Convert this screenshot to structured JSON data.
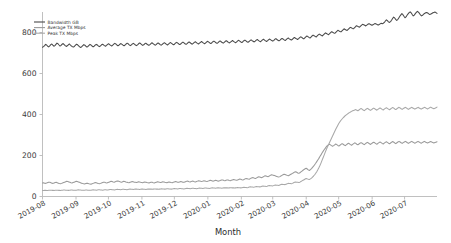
{
  "chart_data": {
    "type": "line",
    "title": "",
    "xlabel": "Month",
    "ylabel": "",
    "grid": false,
    "legend_position": "upper-left",
    "xlim": [
      0,
      365
    ],
    "ylim": [
      0,
      900
    ],
    "yticks": [
      0,
      200,
      400,
      600,
      800
    ],
    "ytick_labels": [
      "0",
      "200",
      "400",
      "600",
      "800"
    ],
    "xtick_labels": [
      "2019-08",
      "2019-09",
      "2019-10",
      "2019-11",
      "2019-12",
      "2020-01",
      "2020-02",
      "2020-03",
      "2020-04",
      "2020-05",
      "2020-06",
      "2020-07"
    ],
    "xtick_positions": [
      0,
      31,
      61,
      92,
      122,
      153,
      184,
      213,
      244,
      274,
      305,
      335
    ],
    "series": [
      {
        "name": "Bandwidth GB",
        "color": "#4a4a4a",
        "values": [
          728,
          731,
          736,
          742,
          739,
          733,
          730,
          735,
          741,
          744,
          738,
          733,
          736,
          742,
          748,
          745,
          739,
          734,
          737,
          743,
          746,
          741,
          736,
          732,
          735,
          740,
          744,
          739,
          734,
          731,
          729,
          733,
          738,
          743,
          740,
          735,
          730,
          727,
          731,
          736,
          741,
          738,
          733,
          729,
          732,
          737,
          742,
          739,
          734,
          730,
          733,
          738,
          742,
          740,
          735,
          731,
          734,
          739,
          743,
          740,
          736,
          733,
          737,
          742,
          745,
          741,
          737,
          734,
          738,
          743,
          747,
          744,
          739,
          735,
          738,
          743,
          746,
          742,
          738,
          735,
          739,
          744,
          748,
          745,
          740,
          736,
          739,
          744,
          747,
          743,
          739,
          736,
          740,
          745,
          749,
          746,
          741,
          737,
          740,
          745,
          748,
          744,
          740,
          737,
          741,
          746,
          750,
          746,
          742,
          738,
          741,
          746,
          749,
          745,
          741,
          738,
          742,
          747,
          750,
          747,
          742,
          739,
          743,
          748,
          751,
          747,
          743,
          740,
          744,
          749,
          752,
          748,
          744,
          741,
          745,
          750,
          753,
          749,
          745,
          742,
          746,
          751,
          754,
          750,
          746,
          743,
          747,
          752,
          755,
          751,
          747,
          744,
          748,
          752,
          756,
          752,
          748,
          745,
          749,
          754,
          757,
          753,
          749,
          746,
          750,
          755,
          758,
          754,
          750,
          747,
          751,
          756,
          759,
          755,
          751,
          748,
          752,
          757,
          760,
          756,
          752,
          749,
          753,
          757,
          761,
          757,
          753,
          750,
          754,
          759,
          762,
          758,
          754,
          751,
          755,
          760,
          763,
          759,
          755,
          752,
          756,
          761,
          764,
          760,
          757,
          754,
          758,
          763,
          766,
          762,
          758,
          755,
          759,
          764,
          767,
          763,
          759,
          756,
          760,
          765,
          768,
          764,
          761,
          758,
          762,
          767,
          770,
          766,
          762,
          759,
          763,
          768,
          771,
          768,
          764,
          761,
          765,
          770,
          773,
          769,
          766,
          763,
          767,
          772,
          776,
          772,
          769,
          766,
          770,
          775,
          779,
          776,
          772,
          769,
          774,
          779,
          783,
          780,
          776,
          773,
          778,
          783,
          787,
          784,
          781,
          778,
          783,
          788,
          792,
          789,
          786,
          783,
          788,
          793,
          798,
          795,
          792,
          789,
          794,
          799,
          804,
          801,
          798,
          796,
          801,
          806,
          811,
          808,
          805,
          803,
          808,
          813,
          818,
          815,
          812,
          810,
          815,
          820,
          825,
          823,
          820,
          818,
          823,
          828,
          833,
          831,
          828,
          826,
          831,
          836,
          840,
          838,
          835,
          832,
          836,
          840,
          843,
          841,
          838,
          835,
          838,
          841,
          844,
          842,
          839,
          836,
          839,
          842,
          845,
          843,
          845,
          849,
          856,
          862,
          858,
          852,
          849,
          853,
          860,
          868,
          875,
          871,
          864,
          859,
          863,
          871,
          879,
          886,
          892,
          887,
          879,
          872,
          876,
          884,
          891,
          897,
          901,
          896,
          888,
          881,
          885,
          892,
          898,
          903,
          899,
          893,
          886,
          881,
          884,
          889,
          893,
          896,
          898,
          895,
          891,
          888,
          890,
          893,
          896,
          898,
          900,
          897,
          893
        ]
      },
      {
        "name": "Average TX Mbps",
        "color": "#9a9a9a",
        "values": [
          66,
          67,
          65,
          64,
          66,
          68,
          70,
          69,
          67,
          65,
          64,
          66,
          68,
          69,
          67,
          65,
          63,
          62,
          64,
          66,
          68,
          70,
          72,
          74,
          73,
          71,
          69,
          67,
          66,
          68,
          70,
          72,
          74,
          73,
          71,
          69,
          67,
          65,
          63,
          62,
          61,
          63,
          65,
          64,
          62,
          61,
          60,
          62,
          64,
          66,
          68,
          67,
          65,
          63,
          62,
          64,
          66,
          68,
          70,
          69,
          67,
          66,
          68,
          70,
          72,
          74,
          73,
          71,
          70,
          72,
          74,
          76,
          75,
          73,
          71,
          70,
          72,
          74,
          73,
          71,
          70,
          68,
          67,
          69,
          71,
          73,
          72,
          70,
          69,
          68,
          70,
          72,
          71,
          69,
          68,
          67,
          69,
          71,
          70,
          68,
          67,
          66,
          68,
          70,
          69,
          67,
          66,
          68,
          70,
          72,
          71,
          69,
          68,
          70,
          72,
          71,
          69,
          68,
          67,
          69,
          71,
          70,
          68,
          67,
          69,
          71,
          73,
          72,
          70,
          69,
          71,
          73,
          72,
          70,
          69,
          71,
          73,
          75,
          74,
          72,
          71,
          73,
          75,
          74,
          72,
          71,
          73,
          75,
          77,
          76,
          74,
          73,
          75,
          77,
          76,
          74,
          73,
          75,
          77,
          79,
          78,
          76,
          75,
          77,
          79,
          78,
          76,
          75,
          77,
          79,
          81,
          80,
          78,
          77,
          79,
          81,
          80,
          78,
          77,
          79,
          81,
          83,
          82,
          80,
          79,
          81,
          83,
          85,
          84,
          82,
          81,
          83,
          86,
          88,
          87,
          85,
          84,
          87,
          90,
          92,
          91,
          89,
          88,
          91,
          94,
          96,
          95,
          93,
          92,
          95,
          98,
          101,
          100,
          98,
          97,
          100,
          103,
          106,
          105,
          103,
          102,
          100,
          98,
          96,
          95,
          97,
          100,
          103,
          106,
          109,
          107,
          105,
          103,
          101,
          104,
          107,
          110,
          113,
          116,
          119,
          121,
          118,
          115,
          113,
          116,
          120,
          124,
          128,
          132,
          135,
          138,
          134,
          130,
          127,
          131,
          136,
          142,
          148,
          155,
          162,
          170,
          178,
          186,
          195,
          203,
          212,
          220,
          228,
          235,
          242,
          248,
          252,
          255,
          252,
          248,
          245,
          248,
          252,
          256,
          253,
          249,
          246,
          250,
          254,
          258,
          255,
          251,
          248,
          252,
          256,
          260,
          257,
          253,
          250,
          254,
          258,
          262,
          259,
          255,
          252,
          256,
          260,
          263,
          260,
          256,
          253,
          257,
          261,
          264,
          261,
          257,
          254,
          258,
          262,
          265,
          262,
          258,
          255,
          259,
          263,
          266,
          263,
          259,
          256,
          260,
          264,
          267,
          264,
          260,
          257,
          261,
          265,
          268,
          265,
          261,
          258,
          262,
          266,
          269,
          266,
          262,
          259,
          263,
          266,
          269,
          266,
          262,
          259,
          263,
          266,
          269,
          266,
          263,
          260,
          263,
          266,
          269,
          266,
          263,
          260,
          263,
          266,
          269,
          266,
          263,
          261,
          263,
          266,
          268,
          266,
          263,
          261,
          263,
          265,
          267
        ]
      },
      {
        "name": "Peak TX Mbps",
        "color": "#a8a8a8",
        "values": [
          29,
          29,
          30,
          30,
          29,
          29,
          30,
          31,
          31,
          30,
          30,
          29,
          30,
          31,
          31,
          30,
          30,
          29,
          30,
          31,
          32,
          32,
          31,
          31,
          30,
          30,
          31,
          32,
          32,
          31,
          31,
          30,
          31,
          32,
          33,
          32,
          32,
          31,
          31,
          30,
          31,
          32,
          32,
          31,
          31,
          30,
          31,
          32,
          33,
          32,
          32,
          31,
          32,
          33,
          33,
          32,
          32,
          31,
          32,
          33,
          33,
          32,
          32,
          33,
          34,
          34,
          33,
          33,
          32,
          33,
          34,
          35,
          34,
          34,
          33,
          34,
          35,
          35,
          34,
          34,
          33,
          34,
          35,
          36,
          35,
          35,
          34,
          35,
          36,
          36,
          35,
          35,
          34,
          35,
          36,
          36,
          35,
          35,
          34,
          35,
          36,
          37,
          36,
          36,
          35,
          36,
          37,
          37,
          36,
          36,
          35,
          36,
          37,
          38,
          37,
          37,
          36,
          37,
          38,
          38,
          37,
          37,
          36,
          37,
          38,
          39,
          38,
          38,
          37,
          38,
          39,
          39,
          38,
          38,
          37,
          38,
          39,
          40,
          39,
          39,
          38,
          39,
          40,
          40,
          39,
          39,
          38,
          39,
          40,
          41,
          40,
          40,
          39,
          40,
          41,
          41,
          40,
          40,
          39,
          40,
          41,
          42,
          41,
          41,
          40,
          41,
          42,
          42,
          41,
          41,
          40,
          41,
          42,
          43,
          42,
          42,
          41,
          42,
          43,
          43,
          42,
          42,
          41,
          42,
          43,
          44,
          43,
          43,
          42,
          43,
          44,
          45,
          44,
          44,
          43,
          44,
          46,
          47,
          46,
          46,
          45,
          46,
          48,
          49,
          48,
          48,
          47,
          48,
          50,
          51,
          50,
          50,
          49,
          50,
          52,
          53,
          52,
          52,
          51,
          53,
          55,
          56,
          55,
          55,
          54,
          56,
          58,
          60,
          59,
          59,
          58,
          60,
          62,
          64,
          63,
          63,
          62,
          64,
          67,
          69,
          71,
          70,
          69,
          68,
          70,
          73,
          76,
          79,
          82,
          85,
          88,
          86,
          84,
          83,
          86,
          90,
          95,
          100,
          106,
          113,
          121,
          130,
          140,
          151,
          163,
          176,
          189,
          202,
          215,
          228,
          240,
          251,
          262,
          273,
          284,
          295,
          306,
          317,
          328,
          338,
          348,
          357,
          365,
          372,
          378,
          384,
          389,
          394,
          398,
          402,
          406,
          409,
          412,
          415,
          418,
          420,
          422,
          424,
          421,
          418,
          422,
          426,
          429,
          426,
          422,
          419,
          423,
          427,
          430,
          427,
          423,
          420,
          424,
          428,
          431,
          428,
          424,
          421,
          425,
          429,
          432,
          429,
          425,
          422,
          426,
          430,
          433,
          430,
          426,
          423,
          427,
          431,
          434,
          431,
          427,
          424,
          428,
          432,
          435,
          432,
          428,
          425,
          429,
          432,
          435,
          432,
          428,
          425,
          429,
          432,
          435,
          432,
          429,
          426,
          429,
          432,
          435,
          432,
          429,
          426,
          429,
          432,
          435,
          433,
          430,
          427,
          430,
          433,
          436,
          433,
          430,
          428,
          430,
          433,
          436
        ]
      }
    ]
  },
  "legend": {
    "items": [
      {
        "label": "Bandwidth GB"
      },
      {
        "label": "Average TX Mbps"
      },
      {
        "label": "Peak TX Mbps"
      }
    ]
  }
}
